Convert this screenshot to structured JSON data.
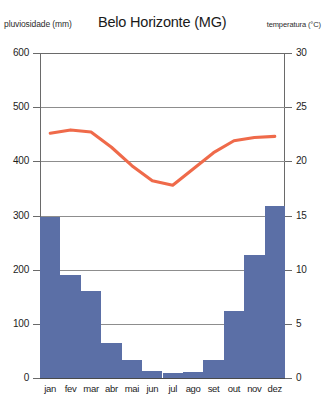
{
  "header": {
    "left_axis_title": "pluviosidade (mm)",
    "title": "Belo Horizonte (MG)",
    "right_axis_title": "temperatura (°C)"
  },
  "colors": {
    "bar": "#5b6fa6",
    "line": "#ef6a4a",
    "grid": "#8d8d8d",
    "axis": "#6a6a6a",
    "text": "#1d1d1d"
  },
  "chart_data": {
    "type": "bar",
    "title": "Belo Horizonte (MG)",
    "subtitle": "",
    "xlabel": "",
    "ylabel": "pluviosidade (mm)",
    "y2label": "temperatura (°C)",
    "categories": [
      "jan",
      "fev",
      "mar",
      "abr",
      "mai",
      "jun",
      "jul",
      "ago",
      "set",
      "out",
      "nov",
      "dez"
    ],
    "ylim": [
      0,
      600
    ],
    "y2lim": [
      0,
      30
    ],
    "yticks": [
      0,
      100,
      200,
      300,
      400,
      500,
      600
    ],
    "y2ticks": [
      0,
      5,
      10,
      15,
      20,
      25,
      30
    ],
    "grid": true,
    "legend": "none",
    "series": [
      {
        "name": "pluviosidade (mm)",
        "type": "bar",
        "axis": "left",
        "unit": "mm",
        "values": [
          297,
          191,
          161,
          65,
          33,
          13,
          10,
          12,
          33,
          124,
          227,
          318
        ]
      },
      {
        "name": "temperatura (°C)",
        "type": "line",
        "axis": "right",
        "unit": "°C",
        "values": [
          22.6,
          22.9,
          22.7,
          21.3,
          19.6,
          18.2,
          17.8,
          19.3,
          20.8,
          21.9,
          22.2,
          22.3
        ]
      }
    ]
  }
}
